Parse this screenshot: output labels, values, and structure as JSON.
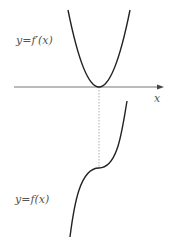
{
  "diagram": {
    "top_label": "y=f′(x)",
    "bottom_label": "y=f(x)",
    "axis_label": "x",
    "colors": {
      "curve": "#222222",
      "axis": "#555555",
      "dotted": "#888888",
      "text": "#555555",
      "background": "#ffffff"
    },
    "elements": [
      {
        "type": "axis",
        "direction": "horizontal",
        "arrow": "right"
      },
      {
        "type": "curve",
        "name": "derivative-parabola",
        "shape": "upward parabola tangent to x-axis"
      },
      {
        "type": "curve",
        "name": "function-cubic",
        "shape": "increasing cubic with horizontal inflection"
      },
      {
        "type": "dotted-line",
        "name": "vertical-guide",
        "connects": "parabola vertex to cubic inflection point"
      }
    ]
  }
}
